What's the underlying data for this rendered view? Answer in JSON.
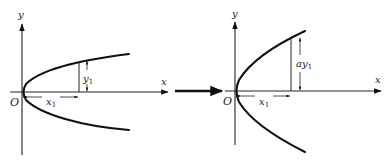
{
  "figure": {
    "left_panel": {
      "y_axis_label": "y",
      "x_axis_label": "x",
      "origin_label": "O",
      "x_dimension_label": "x",
      "x_dimension_subscript": "1",
      "y_dimension_label": "y",
      "y_dimension_subscript": "1"
    },
    "transition_arrow": "right-arrow",
    "right_panel": {
      "y_axis_label": "y",
      "x_axis_label": "x",
      "origin_label": "O",
      "x_dimension_label": "x",
      "x_dimension_subscript": "1",
      "y_dimension_prefix": "a",
      "y_dimension_label": "y",
      "y_dimension_subscript": "1"
    }
  }
}
